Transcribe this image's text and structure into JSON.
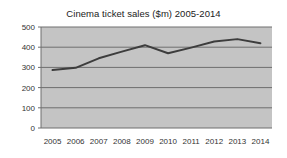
{
  "chart_data": {
    "type": "line",
    "title": "Cinema ticket sales ($m) 2005-2014",
    "xlabel": "",
    "ylabel": "",
    "categories": [
      "2005",
      "2006",
      "2007",
      "2008",
      "2009",
      "2010",
      "2011",
      "2012",
      "2013",
      "2014"
    ],
    "x": [
      2005,
      2006,
      2007,
      2008,
      2009,
      2010,
      2011,
      2012,
      2013,
      2014
    ],
    "values": [
      287,
      298,
      345,
      378,
      410,
      370,
      398,
      428,
      440,
      420
    ],
    "series": [
      {
        "name": "Cinema ticket sales ($m)",
        "values": [
          287,
          298,
          345,
          378,
          410,
          370,
          398,
          428,
          440,
          420
        ]
      }
    ],
    "ylim": [
      0,
      500
    ],
    "ytick_labels": [
      "0",
      "100",
      "200",
      "300",
      "400",
      "500"
    ],
    "yticks": [
      0,
      100,
      200,
      300,
      400,
      500
    ],
    "grid": "horizontal",
    "legend": "none",
    "colors": {
      "line": "#3d3d3d",
      "plot_background": "#c4c4c4",
      "gridline": "#6e6e6e",
      "axis": "#6e6e6e",
      "figure_background": "#ffffff",
      "text": "#333333"
    }
  }
}
